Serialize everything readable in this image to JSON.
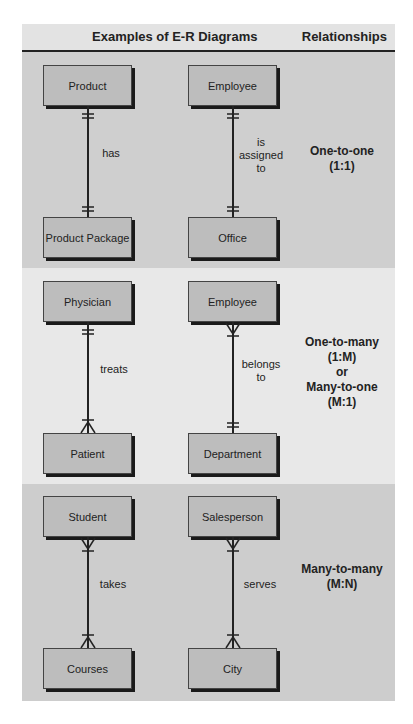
{
  "header": {
    "diagrams_title": "Examples of E-R Diagrams",
    "relationships_title": "Relationships"
  },
  "sections": [
    {
      "relationship": [
        "One-to-one",
        "(1:1)"
      ],
      "examples": [
        {
          "top": "Product",
          "verb": "has",
          "bottom": "Product Package",
          "top_end": "one",
          "bottom_end": "one"
        },
        {
          "top": "Employee",
          "verb": "is assigned to",
          "verb_lines": [
            "is",
            "assigned",
            "to"
          ],
          "bottom": "Office",
          "top_end": "one",
          "bottom_end": "one"
        }
      ]
    },
    {
      "relationship": [
        "One-to-many",
        "(1:M)",
        "or",
        "Many-to-one",
        "(M:1)"
      ],
      "examples": [
        {
          "top": "Physician",
          "verb": "treats",
          "bottom": "Patient",
          "top_end": "one",
          "bottom_end": "many"
        },
        {
          "top": "Employee",
          "verb": "belongs to",
          "verb_lines": [
            "belongs",
            "to"
          ],
          "bottom": "Department",
          "top_end": "many",
          "bottom_end": "one"
        }
      ]
    },
    {
      "relationship": [
        "Many-to-many",
        "(M:N)"
      ],
      "examples": [
        {
          "top": "Student",
          "verb": "takes",
          "bottom": "Courses",
          "top_end": "many",
          "bottom_end": "many"
        },
        {
          "top": "Salesperson",
          "verb": "serves",
          "bottom": "City",
          "top_end": "many",
          "bottom_end": "many"
        }
      ]
    }
  ],
  "colors": {
    "header_bg": "#e3e3e3",
    "section_dark": "#cfcfcf",
    "section_light": "#e8e8e8",
    "entity_fill": "#bdbdbd",
    "ink": "#222222"
  }
}
